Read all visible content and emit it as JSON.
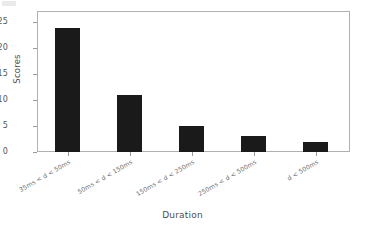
{
  "chart_data": {
    "type": "bar",
    "title": "",
    "subtitle": "",
    "xlabel": "Duration",
    "ylabel": "Scores",
    "categories": [
      "35ms < d < 50ms",
      "50ms < d < 150ms",
      "150ms < d < 250ms",
      "250ms < d < 500ms",
      "d < 500ms"
    ],
    "values": [
      24,
      11,
      5,
      3,
      2
    ],
    "series": [
      {
        "name": "Scores",
        "values": [
          24,
          11,
          5,
          3,
          2
        ]
      }
    ],
    "ylim": [
      0,
      27
    ],
    "yticks": [
      0,
      5,
      10,
      15,
      20,
      25
    ],
    "ytick_labels": [
      "0",
      "5",
      "10",
      "15",
      "20",
      "25"
    ],
    "grid": false,
    "legend": false,
    "legend_position": "none",
    "bar_color": "#1a1a1a",
    "axis_color": "#b0b0b0",
    "text_color": "#4d4d4d",
    "background": "#ffffff",
    "xtick_label_rotation": -30
  },
  "figure": {
    "background_color": "#ffffff"
  }
}
